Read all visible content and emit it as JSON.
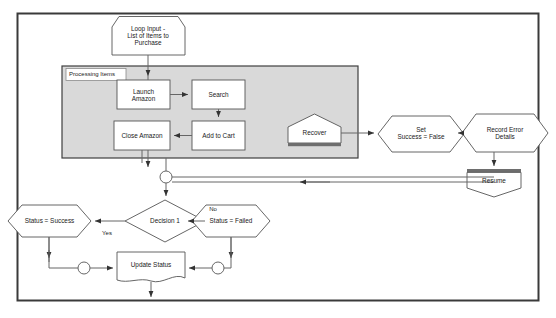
{
  "diagram": {
    "page_border_color": "#3a3a3a",
    "background_color": "#ffffff",
    "shape_fill": "#ffffff",
    "shape_stroke": "#555555",
    "container_fill": "#d9d9d9",
    "container_stroke": "#3f3f3f",
    "connector_color": "#666666",
    "text_color": "#1a1a1a"
  },
  "nodes": {
    "loop_input": {
      "label": "Loop Input -\nList of Items to\nPurchase",
      "shape": "hexagon-tag",
      "x": 148,
      "y": 36
    },
    "container": {
      "label": "Processing Items",
      "shape": "group-box",
      "x": 62,
      "y": 66,
      "w": 296,
      "h": 92
    },
    "launch_amazon": {
      "label": "Launch\nAmazon",
      "shape": "rectangle",
      "x": 117,
      "y": 80,
      "w": 53,
      "h": 29
    },
    "search": {
      "label": "Search",
      "shape": "rectangle",
      "x": 192,
      "y": 80,
      "w": 53,
      "h": 29
    },
    "add_to_cart": {
      "label": "Add to Cart",
      "shape": "rectangle",
      "x": 192,
      "y": 121,
      "w": 53,
      "h": 29
    },
    "close_amazon": {
      "label": "Close Amazon",
      "shape": "rectangle",
      "x": 114,
      "y": 121,
      "w": 56,
      "h": 29
    },
    "recover": {
      "label": "Recover",
      "shape": "pentagon-up",
      "x": 288,
      "y": 120,
      "w": 53,
      "h": 26
    },
    "set_success_false": {
      "label": "Set\nSuccess = False",
      "shape": "hexagon",
      "x": 378,
      "y": 116,
      "w": 72,
      "h": 36
    },
    "record_error_details": {
      "label": "Record Error\nDetails",
      "shape": "hexagon",
      "x": 462,
      "y": 114,
      "w": 72,
      "h": 38
    },
    "resume": {
      "label": "Resume",
      "shape": "pentagon-down",
      "x": 467,
      "y": 172,
      "w": 54,
      "h": 27
    },
    "junction_top": {
      "label": "",
      "shape": "circle",
      "cx": 166,
      "cy": 177,
      "r": 6
    },
    "decision_1": {
      "label": "Decision 1",
      "shape": "diamond",
      "x": 125,
      "y": 200,
      "w": 80,
      "h": 42
    },
    "status_success": {
      "label": "Status = Success",
      "shape": "hexagon",
      "x": 8,
      "y": 205,
      "w": 83,
      "h": 32
    },
    "status_failed": {
      "label": "Status = Failed",
      "shape": "hexagon",
      "x": 192,
      "y": 205,
      "w": 78,
      "h": 32
    },
    "junction_left": {
      "label": "",
      "shape": "circle",
      "cx": 84,
      "cy": 268,
      "r": 6
    },
    "junction_right": {
      "label": "",
      "shape": "circle",
      "cx": 218,
      "cy": 268,
      "r": 6
    },
    "update_status": {
      "label": "Update Status",
      "shape": "document",
      "x": 117,
      "y": 252,
      "w": 68,
      "h": 32
    }
  },
  "edge_labels": {
    "yes": "Yes",
    "no": "No"
  }
}
